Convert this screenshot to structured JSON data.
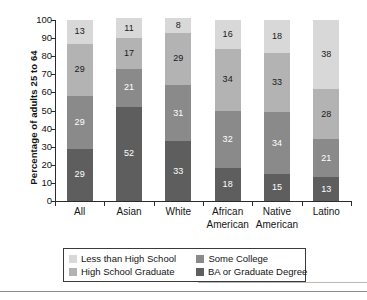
{
  "chart_data": {
    "type": "bar",
    "subtype": "stacked-bar-100",
    "title": "",
    "xlabel": "",
    "ylabel": "Percentage of adults 25 to 64",
    "ylim": [
      0,
      100
    ],
    "yticks": [
      0,
      10,
      20,
      30,
      40,
      50,
      60,
      70,
      80,
      90,
      100
    ],
    "ytick_labels": [
      "0",
      "10",
      "20",
      "30",
      "40",
      "50",
      "60",
      "70",
      "80",
      "90",
      "100"
    ],
    "grid": false,
    "legend_position": "bottom",
    "categories": [
      "All",
      "Asian",
      "White",
      "African American",
      "Native American",
      "Latino"
    ],
    "category_lines": [
      [
        "All",
        ""
      ],
      [
        "Asian",
        ""
      ],
      [
        "White",
        ""
      ],
      [
        "African",
        "American"
      ],
      [
        "Native",
        "American"
      ],
      [
        "Latino",
        ""
      ]
    ],
    "series": [
      {
        "name": "Less than High School",
        "color": "#d8d8d8",
        "label_color": "dark",
        "values": [
          13,
          11,
          8,
          16,
          18,
          38
        ]
      },
      {
        "name": "High School Graduate",
        "color": "#b3b3b3",
        "label_color": "dark",
        "values": [
          29,
          17,
          29,
          34,
          33,
          28
        ]
      },
      {
        "name": "Some College",
        "color": "#8a8a8a",
        "label_color": "light",
        "values": [
          29,
          21,
          31,
          32,
          34,
          21
        ]
      },
      {
        "name": "BA or Graduate Degree",
        "color": "#5e5e5e",
        "label_color": "light",
        "values": [
          29,
          52,
          33,
          18,
          15,
          13
        ]
      }
    ],
    "stack_order_bottom_to_top": [
      "BA or Graduate Degree",
      "Some College",
      "High School Graduate",
      "Less than High School"
    ]
  },
  "legend": {
    "items": [
      {
        "label": "Less than High School",
        "color": "#d8d8d8"
      },
      {
        "label": "Some College",
        "color": "#8a8a8a"
      },
      {
        "label": "High School Graduate",
        "color": "#b3b3b3"
      },
      {
        "label": "BA or Graduate Degree",
        "color": "#5e5e5e"
      }
    ]
  },
  "colors": {
    "axis": "#2b2b2b",
    "text": "#141414",
    "background": "#ffffff",
    "legend_border": "#3a3a3a",
    "rule": "#8e8e8e"
  }
}
